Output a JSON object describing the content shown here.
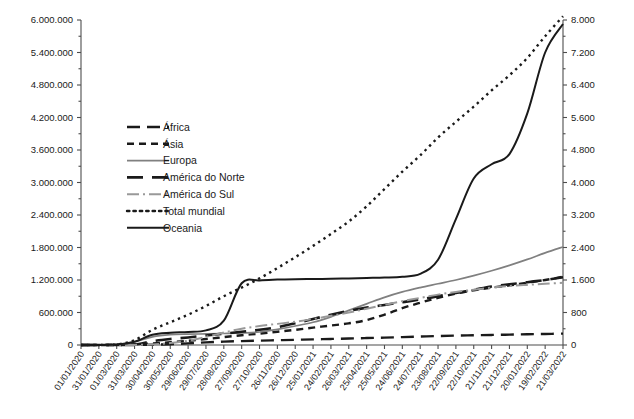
{
  "chart_data": {
    "type": "line",
    "title": "",
    "subtitle": "",
    "xlabel": "",
    "ylabel": "",
    "y2label": "",
    "grid": false,
    "legend_position": "inside-upper-left",
    "categories": [
      "01/01/2020",
      "31/01/2020",
      "01/03/2020",
      "31/03/2020",
      "30/04/2020",
      "30/05/2020",
      "29/06/2020",
      "29/07/2020",
      "28/08/2020",
      "27/09/2020",
      "27/10/2020",
      "26/11/2020",
      "26/12/2020",
      "25/01/2021",
      "24/02/2021",
      "26/03/2021",
      "25/04/2021",
      "25/05/2021",
      "24/06/2021",
      "24/07/2021",
      "23/08/2021",
      "22/09/2021",
      "22/10/2021",
      "21/11/2021",
      "21/12/2021",
      "20/01/2022",
      "19/02/2022",
      "21/03/2022"
    ],
    "ylim": [
      0,
      6000000
    ],
    "yticks": [
      "0",
      "600.000",
      "1.200.000",
      "1.800.000",
      "2.400.000",
      "3.000.000",
      "3.600.000",
      "4.200.000",
      "4.800.000",
      "5.400.000",
      "6.000.000"
    ],
    "ytick_values": [
      0,
      600000,
      1200000,
      1800000,
      2400000,
      3000000,
      3600000,
      4200000,
      4800000,
      5400000,
      6000000
    ],
    "y2lim": [
      0,
      8000
    ],
    "y2ticks": [
      "0",
      "800",
      "1.600",
      "2.400",
      "3.200",
      "4.000",
      "4.800",
      "5.600",
      "6.400",
      "7.200",
      "8.000"
    ],
    "y2tick_values": [
      0,
      800,
      1600,
      2400,
      3200,
      4000,
      4800,
      5600,
      6400,
      7200,
      8000
    ],
    "series": [
      {
        "name": "África",
        "axis": "left",
        "color": "#1a1a1a",
        "width": 2.4,
        "dash": "13,7",
        "values": [
          0,
          0,
          0,
          1000,
          5000,
          15000,
          30000,
          48000,
          62000,
          72000,
          80000,
          88000,
          96000,
          104000,
          112000,
          120000,
          128000,
          136000,
          146000,
          156000,
          166000,
          174000,
          180000,
          186000,
          192000,
          198000,
          204000,
          210000
        ]
      },
      {
        "name": "Ásia",
        "axis": "left",
        "color": "#1a1a1a",
        "width": 2.4,
        "dash": "7,5",
        "values": [
          0,
          1000,
          4000,
          10000,
          28000,
          50000,
          78000,
          110000,
          145000,
          180000,
          210000,
          245000,
          280000,
          320000,
          360000,
          400000,
          460000,
          560000,
          680000,
          780000,
          870000,
          950000,
          1010000,
          1060000,
          1100000,
          1150000,
          1200000,
          1260000
        ]
      },
      {
        "name": "Europa",
        "axis": "left",
        "color": "#808080",
        "width": 1.7,
        "dash": "",
        "values": [
          0,
          0,
          5000,
          60000,
          150000,
          190000,
          200000,
          205000,
          212000,
          222000,
          240000,
          290000,
          350000,
          420000,
          520000,
          640000,
          760000,
          880000,
          980000,
          1060000,
          1130000,
          1200000,
          1280000,
          1370000,
          1470000,
          1580000,
          1700000,
          1810000
        ]
      },
      {
        "name": "América do Norte",
        "axis": "left",
        "color": "#1a1a1a",
        "width": 2.6,
        "dash": "16,9",
        "values": [
          0,
          0,
          1000,
          10000,
          70000,
          110000,
          140000,
          175000,
          210000,
          245000,
          280000,
          330000,
          400000,
          480000,
          560000,
          630000,
          690000,
          740000,
          790000,
          840000,
          900000,
          960000,
          1020000,
          1080000,
          1120000,
          1160000,
          1200000,
          1250000
        ]
      },
      {
        "name": "América do Sul",
        "axis": "left",
        "color": "#999999",
        "width": 2.0,
        "dash": "12,4,2,4",
        "values": [
          0,
          0,
          0,
          2000,
          10000,
          35000,
          80000,
          150000,
          230000,
          300000,
          350000,
          390000,
          430000,
          480000,
          540000,
          600000,
          670000,
          740000,
          810000,
          870000,
          930000,
          980000,
          1020000,
          1060000,
          1090000,
          1110000,
          1130000,
          1150000
        ]
      },
      {
        "name": "Total mundial",
        "axis": "left",
        "color": "#1a1a1a",
        "width": 2.4,
        "dash": "2.4,4",
        "values": [
          0,
          2000,
          10000,
          90000,
          280000,
          420000,
          560000,
          720000,
          900000,
          1060000,
          1230000,
          1420000,
          1620000,
          1830000,
          2050000,
          2280000,
          2560000,
          2880000,
          3200000,
          3500000,
          3830000,
          4120000,
          4400000,
          4700000,
          4980000,
          5300000,
          5700000,
          6070000
        ]
      },
      {
        "name": "Oceania",
        "axis": "right",
        "color": "#1a1a1a",
        "width": 2.0,
        "dash": "",
        "values": [
          0,
          0,
          10,
          80,
          250,
          300,
          320,
          360,
          600,
          1520,
          1590,
          1610,
          1620,
          1625,
          1630,
          1640,
          1650,
          1660,
          1680,
          1750,
          2100,
          3100,
          4100,
          4450,
          4700,
          5700,
          7200,
          7900
        ]
      }
    ]
  },
  "legend": {
    "items": [
      {
        "label": "África"
      },
      {
        "label": "Ásia"
      },
      {
        "label": "Europa"
      },
      {
        "label": "América do Norte"
      },
      {
        "label": "América do Sul"
      },
      {
        "label": "Total mundial"
      },
      {
        "label": "Oceania"
      }
    ]
  }
}
